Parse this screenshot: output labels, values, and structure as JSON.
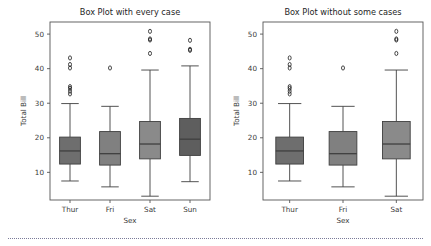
{
  "figure": {
    "width": 431,
    "height": 246,
    "background": "#ffffff",
    "footer_rule": "dotted-separator"
  },
  "chart_data": [
    {
      "type": "box",
      "panel": "left",
      "title": "Box Plot with every case",
      "xlabel": "Sex",
      "ylabel": "Total Bill",
      "categories": [
        "Thur",
        "Fri",
        "Sat",
        "Sun"
      ],
      "ylim": [
        2.0,
        53.5
      ],
      "yticks": [
        10,
        20,
        30,
        40,
        50
      ],
      "grid": false,
      "legend": "none",
      "boxes": [
        {
          "category": "Thur",
          "q1": 12.4,
          "median": 16.2,
          "q3": 20.2,
          "whisker_low": 7.5,
          "whisker_high": 29.9,
          "fliers": [
            32.7,
            33.5,
            34.3,
            34.8,
            40.2,
            41.2,
            43.1
          ],
          "fill": "#6e6e6e"
        },
        {
          "category": "Fri",
          "q1": 12.1,
          "median": 15.4,
          "q3": 21.8,
          "whisker_low": 5.8,
          "whisker_high": 29.1,
          "fliers": [
            40.2
          ],
          "fill": "#808080"
        },
        {
          "category": "Sat",
          "q1": 13.9,
          "median": 18.2,
          "q3": 24.7,
          "whisker_low": 3.1,
          "whisker_high": 39.6,
          "fliers": [
            44.4,
            48.3,
            48.6,
            50.8
          ],
          "fill": "#8a8a8a"
        },
        {
          "category": "Sun",
          "q1": 14.9,
          "median": 19.6,
          "q3": 25.6,
          "whisker_low": 7.3,
          "whisker_high": 40.8,
          "fliers": [
            45.3,
            45.6,
            48.2
          ],
          "fill": "#5e5e5e"
        }
      ]
    },
    {
      "type": "box",
      "panel": "right",
      "title": "Box Plot without some cases",
      "xlabel": "Sex",
      "ylabel": "Total Bill",
      "categories": [
        "Thur",
        "Fri",
        "Sat"
      ],
      "ylim": [
        2.0,
        53.5
      ],
      "yticks": [
        10,
        20,
        30,
        40,
        50
      ],
      "grid": false,
      "legend": "none",
      "boxes": [
        {
          "category": "Thur",
          "q1": 12.4,
          "median": 16.2,
          "q3": 20.2,
          "whisker_low": 7.5,
          "whisker_high": 29.9,
          "fliers": [
            32.7,
            33.5,
            34.3,
            34.8,
            40.2,
            41.2,
            43.1
          ],
          "fill": "#6e6e6e"
        },
        {
          "category": "Fri",
          "q1": 12.1,
          "median": 15.4,
          "q3": 21.8,
          "whisker_low": 5.8,
          "whisker_high": 29.1,
          "fliers": [
            40.2
          ],
          "fill": "#808080"
        },
        {
          "category": "Sat",
          "q1": 13.9,
          "median": 18.2,
          "q3": 24.7,
          "whisker_low": 3.1,
          "whisker_high": 39.6,
          "fliers": [
            44.4,
            48.3,
            48.6,
            50.8
          ],
          "fill": "#8a8a8a"
        }
      ]
    }
  ],
  "style": {
    "box_edge_color": "#3f3f3f",
    "spine_color": "#555555",
    "flier_color": "#1a1a1a",
    "title_color": "#262626",
    "tick_color": "#3a3a3a"
  },
  "layout": {
    "panels": [
      {
        "plot_x": 50,
        "plot_y": 22,
        "plot_w": 160,
        "plot_h": 178
      },
      {
        "plot_x": 263,
        "plot_y": 22,
        "plot_w": 160,
        "plot_h": 178
      }
    ]
  }
}
